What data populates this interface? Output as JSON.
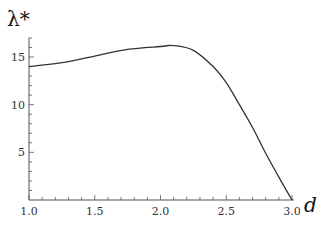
{
  "chart_data": {
    "type": "line",
    "title": "",
    "xlabel": "d",
    "ylabel": "λ*",
    "xlim": [
      1.0,
      3.0
    ],
    "ylim": [
      0,
      17
    ],
    "grid": false,
    "legend": null,
    "x_ticks": [
      1.0,
      1.5,
      2.0,
      2.5,
      3.0
    ],
    "x_tick_labels": [
      "1.0",
      "1.5",
      "2.0",
      "2.5",
      "3.0"
    ],
    "y_ticks": [
      5,
      10,
      15
    ],
    "y_tick_labels": [
      "5",
      "10",
      "15"
    ],
    "series": [
      {
        "name": "λ*(d)",
        "color": "#333333",
        "x": [
          1.0,
          1.25,
          1.5,
          1.75,
          2.0,
          2.1,
          2.25,
          2.4,
          2.5,
          2.6,
          2.7,
          2.8,
          2.9,
          3.0
        ],
        "y": [
          14.0,
          14.4,
          15.1,
          15.8,
          16.1,
          16.2,
          15.7,
          14.0,
          12.3,
          10.0,
          7.6,
          4.9,
          2.4,
          0.0
        ]
      }
    ]
  },
  "layout": {
    "plot_left": 29,
    "plot_right": 292,
    "plot_bottom": 200,
    "plot_top": 38,
    "axis_color": "#555555",
    "line_color": "#333333"
  }
}
